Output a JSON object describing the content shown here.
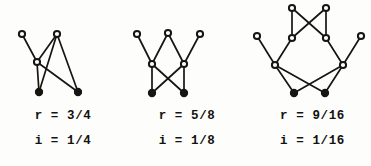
{
  "figure": {
    "background_color": "#fdfdfc",
    "ink_color": "#17150f",
    "panels": [
      {
        "id": "panel-0",
        "caption": {
          "r_line": "r = 3/4",
          "i_line": "i = 1/4"
        },
        "graph": {
          "open_nodes": [
            {
              "name": "node-top-left",
              "x": 22,
              "y": 34
            },
            {
              "name": "node-top-right",
              "x": 57,
              "y": 34
            },
            {
              "name": "node-middle",
              "x": 37,
              "y": 62
            }
          ],
          "filled_nodes": [
            {
              "name": "node-bottom-left",
              "x": 39,
              "y": 92
            },
            {
              "name": "node-bottom-right",
              "x": 78,
              "y": 92
            }
          ],
          "edges": [
            {
              "from": "node-top-left",
              "to": "node-middle"
            },
            {
              "from": "node-top-right",
              "to": "node-middle"
            },
            {
              "from": "node-top-right",
              "to": "node-bottom-left"
            },
            {
              "from": "node-top-right",
              "to": "node-bottom-right"
            },
            {
              "from": "node-middle",
              "to": "node-bottom-left"
            },
            {
              "from": "node-middle",
              "to": "node-bottom-right"
            }
          ]
        }
      },
      {
        "id": "panel-1",
        "caption": {
          "r_line": "r = 5/8",
          "i_line": "i = 1/8"
        },
        "graph": {
          "open_nodes": [
            {
              "name": "node-top-left",
              "x": 13,
              "y": 34
            },
            {
              "name": "node-top-center",
              "x": 44,
              "y": 33
            },
            {
              "name": "node-top-right",
              "x": 76,
              "y": 34
            },
            {
              "name": "node-middle-left",
              "x": 28,
              "y": 64
            },
            {
              "name": "node-middle-right",
              "x": 60,
              "y": 64
            }
          ],
          "filled_nodes": [
            {
              "name": "node-bottom-left",
              "x": 28,
              "y": 93
            },
            {
              "name": "node-bottom-right",
              "x": 60,
              "y": 93
            }
          ],
          "edges": [
            {
              "from": "node-top-left",
              "to": "node-middle-left"
            },
            {
              "from": "node-top-center",
              "to": "node-middle-left"
            },
            {
              "from": "node-top-center",
              "to": "node-middle-right"
            },
            {
              "from": "node-top-right",
              "to": "node-middle-right"
            },
            {
              "from": "node-middle-left",
              "to": "node-bottom-left"
            },
            {
              "from": "node-middle-left",
              "to": "node-bottom-right"
            },
            {
              "from": "node-middle-right",
              "to": "node-bottom-left"
            },
            {
              "from": "node-middle-right",
              "to": "node-bottom-right"
            }
          ]
        }
      },
      {
        "id": "panel-2",
        "caption": {
          "r_line": "r = 9/16",
          "i_line": "i = 1/16"
        },
        "graph": {
          "open_nodes": [
            {
              "name": "node-apex-left",
              "x": 44,
              "y": 8
            },
            {
              "name": "node-apex-right",
              "x": 78,
              "y": 8
            },
            {
              "name": "node-upper-left",
              "x": 44,
              "y": 38
            },
            {
              "name": "node-upper-right",
              "x": 78,
              "y": 38
            },
            {
              "name": "node-outer-left",
              "x": 9,
              "y": 36
            },
            {
              "name": "node-outer-right",
              "x": 113,
              "y": 36
            },
            {
              "name": "node-hub-left",
              "x": 27,
              "y": 65
            },
            {
              "name": "node-hub-right",
              "x": 95,
              "y": 65
            }
          ],
          "filled_nodes": [
            {
              "name": "node-bottom-left",
              "x": 46,
              "y": 93
            },
            {
              "name": "node-bottom-right",
              "x": 77,
              "y": 93
            }
          ],
          "edges": [
            {
              "from": "node-apex-left",
              "to": "node-upper-left"
            },
            {
              "from": "node-apex-right",
              "to": "node-upper-right"
            },
            {
              "from": "node-apex-left",
              "to": "node-upper-right"
            },
            {
              "from": "node-apex-right",
              "to": "node-upper-left"
            },
            {
              "from": "node-outer-left",
              "to": "node-hub-left"
            },
            {
              "from": "node-upper-left",
              "to": "node-hub-left"
            },
            {
              "from": "node-outer-right",
              "to": "node-hub-right"
            },
            {
              "from": "node-upper-right",
              "to": "node-hub-right"
            },
            {
              "from": "node-hub-left",
              "to": "node-bottom-left"
            },
            {
              "from": "node-hub-left",
              "to": "node-bottom-right"
            },
            {
              "from": "node-hub-right",
              "to": "node-bottom-left"
            },
            {
              "from": "node-hub-right",
              "to": "node-bottom-right"
            }
          ]
        }
      }
    ]
  }
}
